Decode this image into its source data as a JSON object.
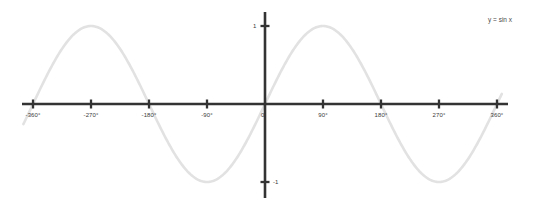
{
  "chart_data": {
    "type": "line",
    "title": "",
    "subtitle": "",
    "xlabel": "",
    "ylabel": "",
    "legend": [
      {
        "name": "y = sin x",
        "color": "#e2e2e2"
      }
    ],
    "legend_position": "top-right",
    "grid": false,
    "axis_color": "#333333",
    "background_color": "#ffffff",
    "xlim": [
      -390,
      375
    ],
    "ylim": [
      -1.22,
      1.22
    ],
    "x_ticks": [
      {
        "value": -360,
        "label": "-360°"
      },
      {
        "value": -270,
        "label": "-270°"
      },
      {
        "value": -180,
        "label": "-180°"
      },
      {
        "value": -90,
        "label": "-90°"
      },
      {
        "value": 0,
        "label": "0"
      },
      {
        "value": 90,
        "label": "90°"
      },
      {
        "value": 180,
        "label": "180°"
      },
      {
        "value": 270,
        "label": "270°"
      },
      {
        "value": 360,
        "label": "360°"
      }
    ],
    "y_ticks": [
      {
        "value": 1,
        "label": "1",
        "side": "left"
      },
      {
        "value": -1,
        "label": "-1",
        "side": "right"
      }
    ],
    "series": [
      {
        "name": "y = sin x",
        "color": "#e2e2e2",
        "x_start": -375,
        "x_end": 368,
        "amplitude": 1,
        "period": 360,
        "phase": 0,
        "equation": "y = sin x",
        "x": [
          -360,
          -330,
          -300,
          -270,
          -240,
          -210,
          -180,
          -150,
          -120,
          -90,
          -60,
          -30,
          0,
          30,
          60,
          90,
          120,
          150,
          180,
          210,
          240,
          270,
          300,
          330,
          360
        ],
        "values": [
          0,
          0.5,
          0.866,
          1,
          0.866,
          0.5,
          0,
          -0.5,
          -0.866,
          -1,
          -0.866,
          -0.5,
          0,
          0.5,
          0.866,
          1,
          0.866,
          0.5,
          0,
          -0.5,
          -0.866,
          -1,
          -0.866,
          -0.5,
          0
        ]
      }
    ]
  },
  "geometry": {
    "origin_x": 265,
    "origin_y": 104,
    "px_per_degree": 0.6444,
    "amplitude_px": 78,
    "x_axis_left": 22,
    "x_axis_right": 508,
    "y_axis_top": 12,
    "y_axis_bottom": 198
  }
}
